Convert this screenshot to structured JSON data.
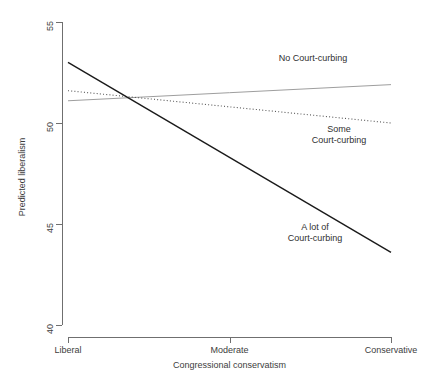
{
  "chart_data": {
    "type": "line",
    "title": "",
    "xlabel": "Congressional conservatism",
    "ylabel": "Predicted liberalism",
    "ylim": [
      40,
      55
    ],
    "yticks": [
      40,
      45,
      50,
      55
    ],
    "ytick_labels": [
      "40",
      "45",
      "50",
      "55"
    ],
    "x": [
      0,
      1,
      2
    ],
    "xtick_labels": [
      "Liberal",
      "Moderate",
      "Conservative"
    ],
    "grid": false,
    "legend_position": "inline-annotations",
    "series": [
      {
        "name": "No Court-curbing",
        "values": [
          51.1,
          51.5,
          51.9
        ],
        "style": "solid",
        "color": "#9e9e9e",
        "width": 1.0,
        "annotation": "No Court-curbing"
      },
      {
        "name": "Some Court-curbing",
        "values": [
          51.6,
          50.8,
          50.0
        ],
        "style": "dotted",
        "color": "#555555",
        "width": 1.1,
        "annotation": "Some\nCourt-curbing"
      },
      {
        "name": "A lot of Court-curbing",
        "values": [
          53.0,
          48.3,
          43.6
        ],
        "style": "solid",
        "color": "#1a1a1a",
        "width": 1.4,
        "annotation": "A lot of\nCourt-curbing"
      }
    ]
  },
  "axes": {
    "y_title": "Predicted liberalism",
    "x_title": "Congressional conservatism",
    "y_ticks": [
      {
        "label": "55",
        "value": 55
      },
      {
        "label": "50",
        "value": 50
      },
      {
        "label": "45",
        "value": 45
      },
      {
        "label": "40",
        "value": 40
      }
    ],
    "x_ticks": [
      {
        "label": "Liberal",
        "value": 0
      },
      {
        "label": "Moderate",
        "value": 1
      },
      {
        "label": "Conservative",
        "value": 2
      }
    ]
  },
  "annotations": {
    "no_curbing": "No Court-curbing",
    "some_curbing": "Some\nCourt-curbing",
    "alot_curbing": "A lot of\nCourt-curbing"
  }
}
